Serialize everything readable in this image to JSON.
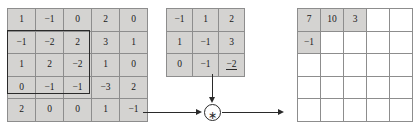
{
  "diagram": {
    "operator_symbol": "∗",
    "operator_name": "convolution-operator"
  },
  "input_matrix": {
    "name": "input-feature-map",
    "rows": 5,
    "cols": 5,
    "values": [
      [
        "1",
        "−1",
        "0",
        "2",
        "0"
      ],
      [
        "−1",
        "−2",
        "2",
        "3",
        "1"
      ],
      [
        "1",
        "2",
        "−2",
        "1",
        "0"
      ],
      [
        "0",
        "−1",
        "−1",
        "−3",
        "2"
      ],
      [
        "2",
        "0",
        "0",
        "1",
        "−1"
      ]
    ],
    "highlight": {
      "name": "receptive-field-box",
      "row_start": 2,
      "row_end": 4,
      "col_start": 1,
      "col_end": 3
    },
    "cell_color": "#d4d3d1",
    "border_color": "#8d8d8d"
  },
  "kernel_matrix": {
    "name": "convolution-kernel",
    "rows": 3,
    "cols": 3,
    "values": [
      [
        "−1",
        "1",
        "2"
      ],
      [
        "1",
        "−1",
        "3"
      ],
      [
        "0",
        "−1",
        "−2"
      ]
    ],
    "underlined_cell": {
      "row": 3,
      "col": 3,
      "value": "−2"
    },
    "cell_color": "#d4d3d1",
    "border_color": "#8d8d8d"
  },
  "output_matrix": {
    "name": "output-feature-map",
    "rows": 5,
    "cols": 5,
    "values": [
      [
        "7",
        "10",
        "3",
        "",
        ""
      ],
      [
        "−1",
        "",
        "",
        "",
        ""
      ],
      [
        "",
        "",
        "",
        "",
        ""
      ],
      [
        "",
        "",
        "",
        "",
        ""
      ],
      [
        "",
        "",
        "",
        "",
        ""
      ]
    ],
    "filled_color": "#d4d3d1",
    "empty_color": "#ffffff",
    "border_color": "#6e6e6e"
  },
  "connectors": {
    "input_to_operator": "arrow-right",
    "kernel_to_operator": "arrow-down",
    "operator_to_output": "arrow-right"
  },
  "colors": {
    "ink": "#2a2a2a",
    "cell_fill": "#d4d3d1",
    "grid_line": "#8d8d8d",
    "background": "#ffffff"
  }
}
